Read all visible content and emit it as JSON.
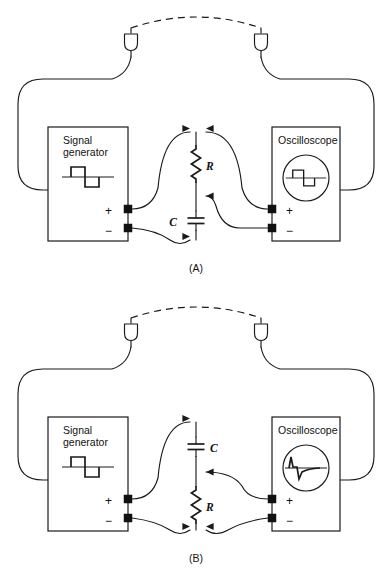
{
  "figure": {
    "panels": [
      {
        "id": "A",
        "caption": "(A)",
        "source": {
          "name": "signal-generator",
          "label_line1": "Signal",
          "label_line2": "generator",
          "waveform": "square-wave",
          "terminals": {
            "positive": "+",
            "negative": "−"
          }
        },
        "display": {
          "name": "oscilloscope",
          "label": "Oscilloscope",
          "waveform": "square-wave",
          "terminals": {
            "positive": "+",
            "negative": "−"
          }
        },
        "circuit": {
          "type": "integrator",
          "top_component": {
            "symbol": "resistor",
            "label": "R"
          },
          "bottom_component": {
            "symbol": "capacitor",
            "label": "C"
          }
        },
        "ground_link": {
          "style": "dashed-arc",
          "connectors": 2
        }
      },
      {
        "id": "B",
        "caption": "(B)",
        "source": {
          "name": "signal-generator",
          "label_line1": "Signal",
          "label_line2": "generator",
          "waveform": "square-wave",
          "terminals": {
            "positive": "+",
            "negative": "−"
          }
        },
        "display": {
          "name": "oscilloscope",
          "label": "Oscilloscope",
          "waveform": "spike-wave",
          "terminals": {
            "positive": "+",
            "negative": "−"
          }
        },
        "circuit": {
          "type": "differentiator",
          "top_component": {
            "symbol": "capacitor",
            "label": "C"
          },
          "bottom_component": {
            "symbol": "resistor",
            "label": "R"
          }
        },
        "ground_link": {
          "style": "dashed-arc",
          "connectors": 2
        }
      }
    ]
  },
  "colors": {
    "ink": "#1a1a1a",
    "background": "#ffffff",
    "terminal": "#111111"
  }
}
